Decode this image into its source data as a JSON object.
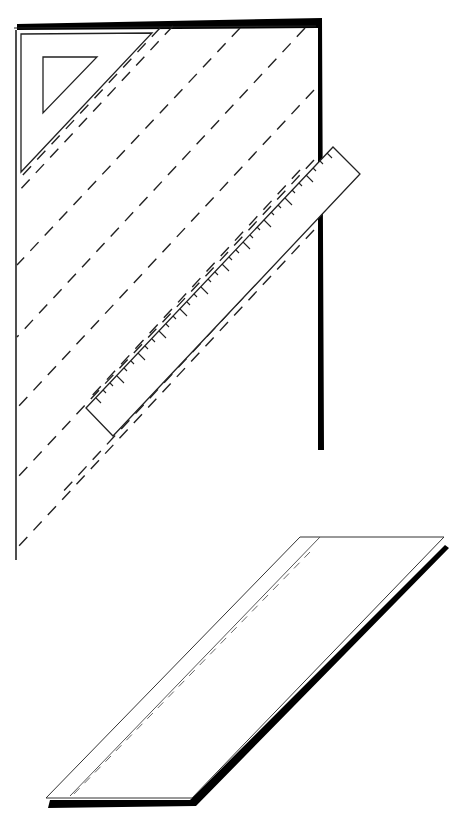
{
  "figure": {
    "stroke_color": "#1a1a1a",
    "shadow_color": "#000000",
    "background": "#ffffff",
    "labels": []
  },
  "fabric_sheet": {
    "bias_line_count": 9,
    "tools": [
      "set-square",
      "ruler"
    ]
  },
  "bias_strip": {
    "fold_line": "dashed"
  }
}
